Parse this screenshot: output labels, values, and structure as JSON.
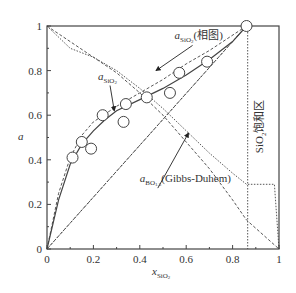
{
  "chart_data": {
    "type": "line",
    "title": "",
    "xlabel": "x",
    "xlabel_sub": "SiO",
    "xlabel_sub2": "2",
    "ylabel": "a",
    "xlim": [
      0,
      1
    ],
    "ylim": [
      0,
      1
    ],
    "xticks": [
      0,
      0.2,
      0.4,
      0.6,
      0.8,
      1
    ],
    "yticks": [
      0,
      0.2,
      0.4,
      0.6,
      0.8,
      1
    ],
    "xtick_labels": [
      "0",
      "0.2",
      "0.4",
      "0.6",
      "0.8",
      "1"
    ],
    "ytick_labels": [
      "0",
      "0.2",
      "0.4",
      "0.6",
      "0.8",
      "1"
    ],
    "grid": false,
    "series": [
      {
        "name": "a_SiO2 (calculated)",
        "style": "solid",
        "points": [
          [
            0,
            0
          ],
          [
            0.05,
            0.22
          ],
          [
            0.1,
            0.38
          ],
          [
            0.15,
            0.47
          ],
          [
            0.2,
            0.53
          ],
          [
            0.25,
            0.58
          ],
          [
            0.3,
            0.62
          ],
          [
            0.4,
            0.67
          ],
          [
            0.5,
            0.72
          ],
          [
            0.6,
            0.78
          ],
          [
            0.7,
            0.85
          ],
          [
            0.8,
            0.93
          ],
          [
            0.86,
            1.0
          ]
        ]
      },
      {
        "name": "a_SiO2 (phase diagram)",
        "style": "dashed",
        "points": [
          [
            0,
            0
          ],
          [
            0.05,
            0.25
          ],
          [
            0.1,
            0.41
          ],
          [
            0.15,
            0.51
          ],
          [
            0.2,
            0.57
          ],
          [
            0.3,
            0.64
          ],
          [
            0.4,
            0.7
          ],
          [
            0.5,
            0.76
          ],
          [
            0.6,
            0.83
          ],
          [
            0.7,
            0.89
          ],
          [
            0.86,
            1.0
          ]
        ]
      },
      {
        "name": "a_SiO2 (phase diagram) upper",
        "style": "dashed",
        "points": [
          [
            0,
            0
          ],
          [
            0.86,
            1.0
          ]
        ],
        "note": "straight dashed from origin region to saturation"
      },
      {
        "name": "a_BO1.5 (Gibbs-Duhem)",
        "style": "dashed",
        "points": [
          [
            0,
            1.0
          ],
          [
            0.1,
            0.93
          ],
          [
            0.2,
            0.86
          ],
          [
            0.3,
            0.79
          ],
          [
            0.4,
            0.7
          ],
          [
            0.5,
            0.6
          ],
          [
            0.6,
            0.48
          ],
          [
            0.7,
            0.36
          ],
          [
            0.8,
            0.22
          ],
          [
            0.86,
            0.13
          ],
          [
            1.0,
            0.0
          ]
        ]
      },
      {
        "name": "a_BO1.5 upper",
        "style": "dotted",
        "points": [
          [
            0,
            1.0
          ],
          [
            0.1,
            0.9
          ],
          [
            0.2,
            0.86
          ],
          [
            0.3,
            0.8
          ],
          [
            0.4,
            0.72
          ],
          [
            0.5,
            0.63
          ],
          [
            0.6,
            0.53
          ],
          [
            0.7,
            0.43
          ],
          [
            0.8,
            0.34
          ],
          [
            0.86,
            0.29
          ],
          [
            0.98,
            0.29
          ],
          [
            1.0,
            0.0
          ]
        ]
      },
      {
        "name": "a_BO1.5 from 0 to 0.86",
        "style": "dotted",
        "points": [
          [
            0,
            0
          ],
          [
            0.86,
            1.0
          ]
        ]
      }
    ],
    "scatter": {
      "name": "experimental a_SiO2",
      "points": [
        [
          0.11,
          0.41
        ],
        [
          0.15,
          0.48
        ],
        [
          0.19,
          0.45
        ],
        [
          0.24,
          0.6
        ],
        [
          0.33,
          0.57
        ],
        [
          0.34,
          0.65
        ],
        [
          0.43,
          0.68
        ],
        [
          0.53,
          0.7
        ],
        [
          0.57,
          0.79
        ],
        [
          0.69,
          0.84
        ],
        [
          0.86,
          1.0
        ]
      ]
    },
    "vlines": [
      {
        "x": 0.865,
        "style": "dotted"
      }
    ],
    "annotations": [
      {
        "text_main": "a",
        "text_sub": "SiO",
        "text_sub2": "2",
        "text_after": "(相图)",
        "at": [
          0.55,
          0.94
        ],
        "arrow_to": [
          0.47,
          0.8
        ]
      },
      {
        "text_main": "a",
        "text_sub": "SiO",
        "text_sub2": "2",
        "text_after": "",
        "at": [
          0.22,
          0.76
        ],
        "arrow_to": [
          0.29,
          0.62
        ]
      },
      {
        "text_main": "a",
        "text_sub": "BO",
        "text_sub2": "1.5",
        "text_after": "(Gibbs-Duhem)",
        "at": [
          0.4,
          0.3
        ],
        "arrow_to": [
          0.61,
          0.52
        ]
      },
      {
        "text_main": "SiO",
        "text_sub": "2",
        "text_after": "饱和区",
        "at": [
          0.93,
          0.55
        ],
        "rotated": true
      }
    ]
  }
}
